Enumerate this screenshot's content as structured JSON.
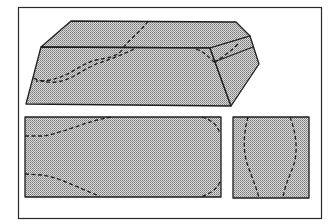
{
  "figure": {
    "colors": {
      "background": "#ffffff",
      "outline": "#1e1e1e",
      "fill_pattern": "stippled gray dots",
      "fill_base": "#c8c8c8"
    },
    "views": [
      {
        "name": "isometric-view",
        "label": ""
      },
      {
        "name": "front-view",
        "label": ""
      },
      {
        "name": "side-view",
        "label": ""
      }
    ]
  }
}
